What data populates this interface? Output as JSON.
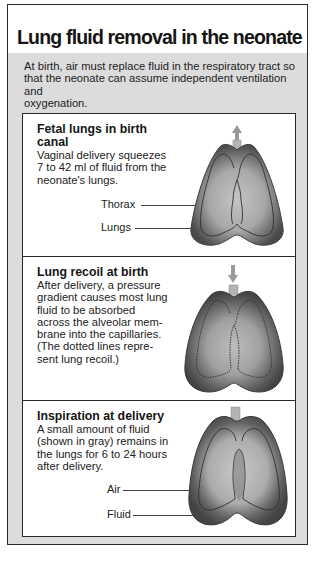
{
  "title": "Lung fluid removal in the neonate",
  "intro": "At birth, air must replace fluid in the respiratory tract so that the neonate can assume independent ventilation and oxygenation.",
  "intro_lines": [
    "At birth, air must replace fluid in the respiratory tract so",
    "that the neonate can assume independent ventilation and",
    "oxygenation."
  ],
  "panels": [
    {
      "heading_lines": [
        "Fetal lungs in birth",
        "canal"
      ],
      "body_lines": [
        "Vaginal delivery squeezes",
        "7 to 42 ml of fluid from the",
        "neonate's lungs."
      ],
      "labels": [
        "Thorax",
        "Lungs"
      ],
      "arrow": "up-arrow-icon"
    },
    {
      "heading_lines": [
        "Lung recoil at birth"
      ],
      "body_lines": [
        "After delivery, a pressure",
        "gradient causes most lung",
        "fluid to be absorbed",
        "across the alveolar mem-",
        "brane into the capillaries.",
        "(The dotted lines repre-",
        "sent lung recoil.)"
      ],
      "labels": [],
      "arrow": "down-arrow-icon"
    },
    {
      "heading_lines": [
        "Inspiration at delivery"
      ],
      "body_lines": [
        "A small amount of fluid",
        "(shown in gray) remains in",
        "the lungs for 6 to 24 hours",
        "after delivery."
      ],
      "labels": [
        "Air",
        "Fluid"
      ],
      "arrow": ""
    }
  ],
  "colors": {
    "frame_gray": "#dcdcdc",
    "border": "#2a2a2a",
    "lung_dark": "#5a5a5a",
    "lung_light": "#b8b8b8"
  }
}
